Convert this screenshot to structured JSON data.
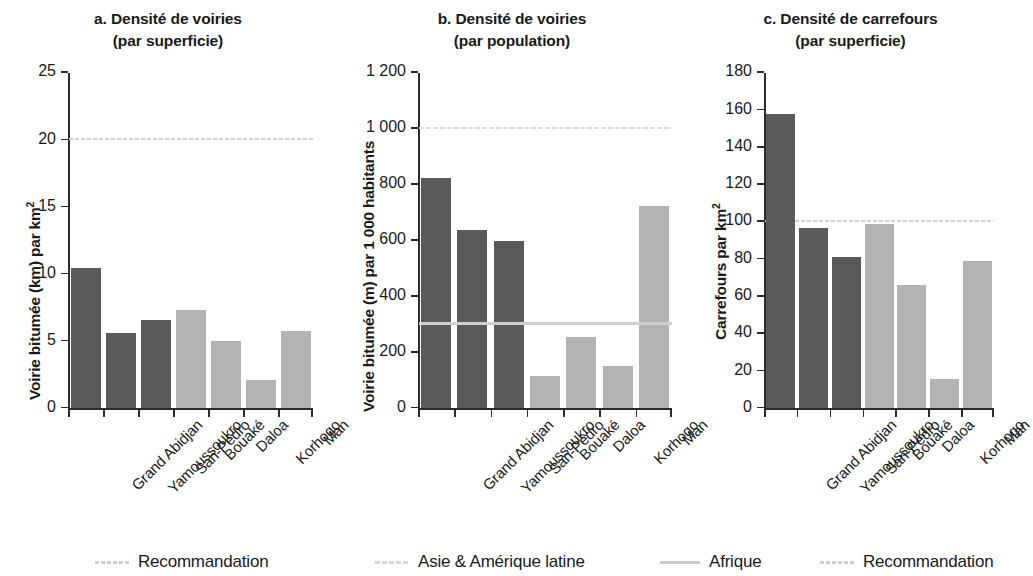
{
  "figure": {
    "panels": [
      {
        "id": "a",
        "title_line1": "a. Densité de voiries",
        "title_line2": "(par superficie)",
        "ylabel_main": "Voirie bitumée (km) par km",
        "ylabel_sup": "2"
      },
      {
        "id": "b",
        "title_line1": "b. Densité de voiries",
        "title_line2": "(par population)",
        "ylabel_main": "Voirie bitumée (m) par 1 000 habitants",
        "ylabel_sup": ""
      },
      {
        "id": "c",
        "title_line1": "c. Densité de carrefours",
        "title_line2": "(par superficie)",
        "ylabel_main": "Carrefours par km",
        "ylabel_sup": "2"
      }
    ]
  },
  "legend": {
    "items": [
      {
        "label": "Recommandation",
        "style": "reco"
      },
      {
        "label": "Asie & Amérique latine",
        "style": "asie"
      },
      {
        "label": "Afrique",
        "style": "afrique"
      },
      {
        "label": "Recommandation",
        "style": "reco"
      }
    ]
  },
  "colors": {
    "bar_dark": "#5a5a5a",
    "bar_light": "#b3b3b3",
    "axis": "#2b2b2b",
    "refline_reco": "#d4d4d4",
    "refline_asie": "#dcdcdc",
    "refline_afrique": "#cfcfcf",
    "text": "#1a1a1a"
  },
  "chart_data": [
    {
      "type": "bar",
      "panel": "a",
      "title": "a. Densité de voiries (par superficie)",
      "xlabel": "",
      "ylabel": "Voirie bitumée (km) par km²",
      "ylim": [
        0,
        25
      ],
      "yticks": [
        0,
        5,
        10,
        15,
        20,
        25
      ],
      "ytick_labels": [
        "0",
        "5",
        "10",
        "15",
        "20",
        "25"
      ],
      "grid": false,
      "categories": [
        "Grand Abidjan",
        "Yamoussoukro",
        "San-Pédro",
        "Bouaké",
        "Daloa",
        "Korhogo",
        "Man"
      ],
      "values": [
        10.5,
        5.6,
        6.6,
        7.3,
        5.0,
        2.1,
        5.8
      ],
      "bar_colors": [
        "dark",
        "dark",
        "dark",
        "light",
        "light",
        "light",
        "light"
      ],
      "reference_lines": [
        {
          "name": "Recommandation",
          "value": 20,
          "style": "reco"
        }
      ]
    },
    {
      "type": "bar",
      "panel": "b",
      "title": "b. Densité de voiries (par population)",
      "xlabel": "",
      "ylabel": "Voirie bitumée (m) par 1 000 habitants",
      "ylim": [
        0,
        1200
      ],
      "yticks": [
        0,
        200,
        400,
        600,
        800,
        1000,
        1200
      ],
      "ytick_labels": [
        "0",
        "200",
        "400",
        "600",
        "800",
        "1 000",
        "1 200"
      ],
      "grid": false,
      "categories": [
        "Grand Abidjan",
        "Yamoussoukro",
        "San-Pédro",
        "Bouaké",
        "Daloa",
        "Korhogo",
        "Man"
      ],
      "values": [
        825,
        640,
        600,
        115,
        255,
        150,
        725
      ],
      "bar_colors": [
        "dark",
        "dark",
        "dark",
        "light",
        "light",
        "light",
        "light"
      ],
      "reference_lines": [
        {
          "name": "Asie & Amérique latine",
          "value": 1000,
          "style": "asie"
        },
        {
          "name": "Afrique",
          "value": 300,
          "style": "afrique"
        }
      ]
    },
    {
      "type": "bar",
      "panel": "c",
      "title": "c. Densité de carrefours (par superficie)",
      "xlabel": "",
      "ylabel": "Carrefours par km²",
      "ylim": [
        0,
        180
      ],
      "yticks": [
        0,
        20,
        40,
        60,
        80,
        100,
        120,
        140,
        160,
        180
      ],
      "ytick_labels": [
        "0",
        "20",
        "40",
        "60",
        "80",
        "100",
        "120",
        "140",
        "160",
        "180"
      ],
      "grid": false,
      "categories": [
        "Grand Abidjan",
        "Yamoussoukro",
        "San-Pédro",
        "Bouaké",
        "Daloa",
        "Korhogo",
        "Man"
      ],
      "values": [
        158,
        97,
        81,
        99,
        66,
        16,
        79
      ],
      "bar_colors": [
        "dark",
        "dark",
        "dark",
        "light",
        "light",
        "light",
        "light"
      ],
      "reference_lines": [
        {
          "name": "Recommandation",
          "value": 100,
          "style": "reco"
        }
      ]
    }
  ]
}
